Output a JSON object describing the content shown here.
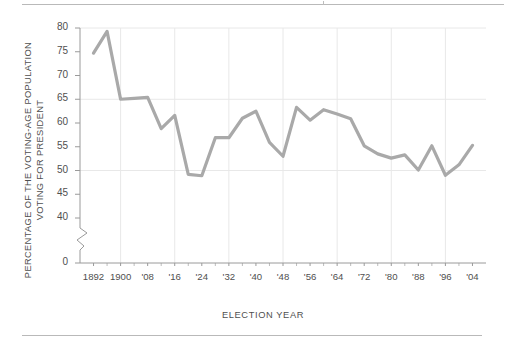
{
  "figure": {
    "top_rule": "horizontal-rule",
    "bottom_rule": "horizontal-rule"
  },
  "axis": {
    "ylabel_line1": "PERCENTAGE OF THE VOTING-AGE POPULATION",
    "ylabel_line2": "VOTING FOR PRESIDENT",
    "xlabel": "ELECTION YEAR"
  },
  "colors": {
    "line": "#a9a9a9",
    "grid": "#e8e8e8",
    "axis": "#9a9a9a",
    "text": "#4f4f4f"
  },
  "chart_data": {
    "type": "line",
    "title": "",
    "xlabel": "ELECTION YEAR",
    "ylabel": "PERCENTAGE OF THE VOTING-AGE POPULATION VOTING FOR PRESIDENT",
    "x": [
      1892,
      1896,
      1900,
      1904,
      1908,
      1912,
      1916,
      1920,
      1924,
      1928,
      1932,
      1936,
      1940,
      1944,
      1948,
      1952,
      1956,
      1960,
      1964,
      1968,
      1972,
      1976,
      1980,
      1984,
      1988,
      1992,
      1996,
      2000,
      2004
    ],
    "values": [
      74.7,
      79.3,
      65.0,
      65.2,
      65.4,
      58.8,
      61.6,
      49.2,
      48.9,
      56.9,
      56.9,
      61.0,
      62.5,
      55.9,
      53.0,
      63.3,
      60.6,
      62.8,
      61.9,
      60.9,
      55.2,
      53.5,
      52.6,
      53.3,
      50.1,
      55.2,
      49.0,
      51.2,
      55.3
    ],
    "series": [
      {
        "name": "Voter turnout",
        "values": [
          74.7,
          79.3,
          65.0,
          65.2,
          65.4,
          58.8,
          61.6,
          49.2,
          48.9,
          56.9,
          56.9,
          61.0,
          62.5,
          55.9,
          53.0,
          63.3,
          60.6,
          62.8,
          61.9,
          60.9,
          55.2,
          53.5,
          52.6,
          53.3,
          50.1,
          55.2,
          49.0,
          51.2,
          55.3
        ]
      }
    ],
    "xtick_labels": [
      "1892",
      "1900",
      "'08",
      "'16",
      "'24",
      "'32",
      "'40",
      "'48",
      "'56",
      "'64",
      "'72",
      "'80",
      "'88",
      "'96",
      "'04"
    ],
    "xtick_values": [
      1892,
      1900,
      1908,
      1916,
      1924,
      1932,
      1940,
      1948,
      1956,
      1964,
      1972,
      1980,
      1988,
      1996,
      2004
    ],
    "ytick_labels": [
      "0",
      "40",
      "45",
      "50",
      "55",
      "60",
      "65",
      "70",
      "75",
      "80"
    ],
    "ytick_values": [
      0,
      40,
      45,
      50,
      55,
      60,
      65,
      70,
      75,
      80
    ],
    "ylim": [
      40,
      80
    ],
    "xlim": [
      1888,
      2008
    ],
    "axis_break": true,
    "axis_break_between": [
      0,
      40
    ],
    "grid": "both-light",
    "gridlines_y": [
      50,
      65,
      80
    ],
    "gridlines_x": [
      1900,
      1916,
      1932,
      1948,
      1964,
      1980,
      1996
    ],
    "legend": "none"
  }
}
